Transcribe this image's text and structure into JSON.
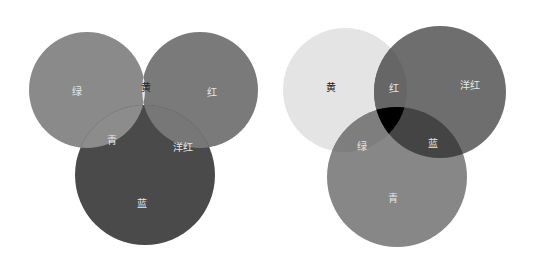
{
  "diagrams": [
    {
      "name": "additive-rgb",
      "circles": [
        {
          "id": "green",
          "label": "绿",
          "cx": 87,
          "cy": 90,
          "r": 58,
          "fill": "#8a8a8a"
        },
        {
          "id": "red",
          "label": "红",
          "cx": 200,
          "cy": 90,
          "r": 58,
          "fill": "#7a7a7a"
        },
        {
          "id": "blue",
          "label": "蓝",
          "cx": 145,
          "cy": 175,
          "r": 70,
          "fill": "#4a4a4a"
        }
      ],
      "overlaps": {
        "yellow": {
          "label": "黄",
          "fill": "#e6e6e6"
        },
        "cyan": {
          "label": "青",
          "fill": "#8c8c8c"
        },
        "magenta": {
          "label": "洋红",
          "fill": "#777777"
        },
        "white": {
          "label": "",
          "fill": "#ffffff"
        }
      },
      "labels": [
        {
          "text": "绿",
          "x": 77,
          "y": 92,
          "color": "#e6e6e6"
        },
        {
          "text": "黄",
          "x": 146,
          "y": 88,
          "color": "#222222"
        },
        {
          "text": "红",
          "x": 212,
          "y": 93,
          "color": "#e6e6e6"
        },
        {
          "text": "青",
          "x": 112,
          "y": 141,
          "color": "#e6e6e6"
        },
        {
          "text": "洋红",
          "x": 183,
          "y": 148,
          "color": "#e6e6e6"
        },
        {
          "text": "蓝",
          "x": 142,
          "y": 204,
          "color": "#e6e6e6"
        }
      ]
    },
    {
      "name": "subtractive-cmy",
      "circles": [
        {
          "id": "yellow",
          "label": "黄",
          "cx": 345,
          "cy": 90,
          "r": 62,
          "fill": "#e4e4e4"
        },
        {
          "id": "magenta",
          "label": "洋红",
          "cx": 440,
          "cy": 92,
          "r": 66,
          "fill": "#6e6e6e"
        },
        {
          "id": "cyan",
          "label": "青",
          "cx": 397,
          "cy": 177,
          "r": 70,
          "fill": "#878787"
        }
      ],
      "overlaps": {
        "red": {
          "label": "红",
          "fill": "#666666"
        },
        "green": {
          "label": "绿",
          "fill": "#7e7e7e"
        },
        "blue": {
          "label": "蓝",
          "fill": "#444444"
        },
        "black": {
          "label": "",
          "fill": "#000000"
        }
      },
      "labels": [
        {
          "text": "黄",
          "x": 331,
          "y": 88,
          "color": "#222222"
        },
        {
          "text": "红",
          "x": 394,
          "y": 89,
          "color": "#e6e6e6"
        },
        {
          "text": "洋红",
          "x": 470,
          "y": 86,
          "color": "#e6e6e6"
        },
        {
          "text": "绿",
          "x": 362,
          "y": 147,
          "color": "#e6e6e6"
        },
        {
          "text": "蓝",
          "x": 433,
          "y": 144,
          "color": "#e6e6e6"
        },
        {
          "text": "青",
          "x": 393,
          "y": 199,
          "color": "#e6e6e6"
        }
      ]
    }
  ]
}
